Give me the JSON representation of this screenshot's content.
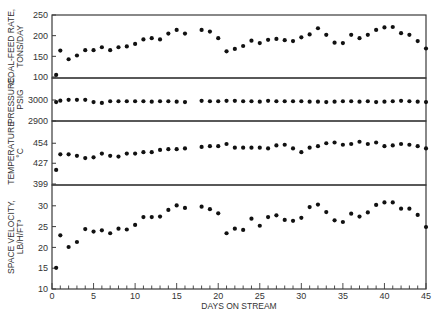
{
  "chart_data": {
    "type": "scatter",
    "layout": "four vertically stacked panels sharing the x-axis",
    "xlabel": "DAYS ON STREAM",
    "xlim": [
      0,
      45
    ],
    "xticks": [
      0,
      5,
      10,
      15,
      20,
      25,
      30,
      35,
      40,
      45
    ],
    "grid": false,
    "legend": null,
    "x": [
      0.5,
      1,
      2,
      3,
      4,
      5,
      6,
      7,
      8,
      9,
      10,
      11,
      12,
      13,
      14,
      15,
      16,
      18,
      19,
      20,
      21,
      22,
      23,
      24,
      25,
      26,
      27,
      28,
      29,
      30,
      31,
      32,
      33,
      34,
      35,
      36,
      37,
      38,
      39,
      40,
      41,
      42,
      43,
      44,
      45
    ],
    "panels": [
      {
        "ylabel": [
          "COAL-FEED RATE,",
          "TONS/DAY"
        ],
        "ylim": [
          100,
          250
        ],
        "yticks": [
          100,
          150,
          200,
          250
        ],
        "values": [
          105,
          164,
          143,
          152,
          165,
          165,
          172,
          165,
          172,
          174,
          180,
          191,
          194,
          191,
          205,
          214,
          205,
          214,
          210,
          194,
          162,
          168,
          175,
          188,
          182,
          190,
          192,
          189,
          187,
          196,
          203,
          218,
          202,
          183,
          182,
          202,
          194,
          202,
          214,
          220,
          221,
          206,
          202,
          187,
          169
        ]
      },
      {
        "ylabel": [
          "PRESSURE,",
          "PSIG"
        ],
        "ylim": [
          2900,
          3050
        ],
        "yticks": [
          2900,
          3000
        ],
        "values": [
          2990,
          2997,
          3001,
          3001,
          3001,
          2990,
          2986,
          2994,
          2994,
          2994,
          2994,
          2994,
          2992,
          2994,
          2994,
          2992,
          2990,
          2996,
          2994,
          2994,
          2996,
          2996,
          2994,
          2994,
          2992,
          2996,
          2994,
          2994,
          2994,
          2994,
          2992,
          2992,
          2990,
          2992,
          2994,
          2994,
          2992,
          2994,
          2990,
          2992,
          2994,
          2996,
          2994,
          2992,
          2990
        ]
      },
      {
        "ylabel": [
          "TEMPERATURE",
          "°C"
        ],
        "ylim": [
          399,
          482
        ],
        "yticks": [
          399,
          427,
          454
        ],
        "values": [
          418,
          439,
          439,
          437,
          434,
          435,
          440,
          437,
          436,
          440,
          440,
          442,
          442,
          445,
          446,
          446,
          447,
          449,
          450,
          450,
          453,
          448,
          448,
          448,
          448,
          447,
          451,
          452,
          447,
          442,
          448,
          450,
          454,
          455,
          452,
          453,
          456,
          453,
          455,
          450,
          451,
          453,
          452,
          450,
          447
        ]
      },
      {
        "ylabel": [
          "SPACE VELOCITY,",
          "LB/H/FT³"
        ],
        "ylim": [
          10,
          35
        ],
        "yticks": [
          10,
          15,
          20,
          25,
          30
        ],
        "values": [
          15.1,
          22.9,
          20.1,
          21.3,
          24.4,
          23.8,
          24.1,
          23.4,
          24.5,
          24.3,
          25.4,
          27.3,
          27.3,
          27.4,
          29.0,
          30.1,
          29.5,
          29.8,
          29.2,
          28.2,
          23.4,
          24.5,
          24.2,
          26.9,
          25.2,
          27.3,
          27.7,
          26.6,
          26.4,
          27.1,
          29.7,
          30.3,
          28.5,
          26.5,
          26.1,
          28.1,
          27.4,
          28.4,
          30.2,
          30.8,
          30.8,
          29.3,
          29.3,
          27.8,
          24.9
        ]
      }
    ]
  },
  "axis": {
    "x_title": "DAYS ON STREAM",
    "x_ticks": [
      "0",
      "5",
      "10",
      "15",
      "20",
      "25",
      "30",
      "35",
      "40",
      "45"
    ]
  },
  "colors": {
    "frame": "#3a3a3a",
    "marker": "#111111",
    "text": "#333333",
    "background": "#ffffff"
  }
}
